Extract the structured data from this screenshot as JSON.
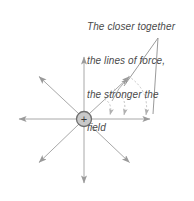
{
  "figure": {
    "kind": "physics-field-line-diagram",
    "width": 194,
    "height": 201,
    "background": "#ffffff"
  },
  "annotation": {
    "full_text": "The closer together the lines of force, the stronger the field",
    "lines": [
      "The closer together",
      "the lines of force,",
      "the stronger the",
      "field"
    ],
    "style": "italic",
    "color": "#4a4a4a"
  },
  "charge": {
    "symbol": "+",
    "label": "positive-point-charge",
    "center_x": 84,
    "center_y": 119,
    "radius": 7.5,
    "fill": "#c9c9c9",
    "stroke": "#6e6e6e",
    "symbol_color": "#3a3a3a"
  },
  "field_lines": {
    "count": 8,
    "stroke": "#a8a8a8",
    "stroke_width": 1,
    "directions": [
      {
        "name": "up",
        "angle_deg": 90,
        "tip_x": 84,
        "tip_y": 55
      },
      {
        "name": "up-right",
        "angle_deg": 45,
        "tip_x": 131,
        "tip_y": 75
      },
      {
        "name": "right",
        "angle_deg": 0,
        "tip_x": 152,
        "tip_y": 119
      },
      {
        "name": "down-right",
        "angle_deg": -45,
        "tip_x": 131,
        "tip_y": 164
      },
      {
        "name": "down",
        "angle_deg": -90,
        "tip_x": 84,
        "tip_y": 185
      },
      {
        "name": "down-left",
        "angle_deg": -135,
        "tip_x": 37,
        "tip_y": 164
      },
      {
        "name": "left",
        "angle_deg": 180,
        "tip_x": 17,
        "tip_y": 119
      },
      {
        "name": "up-left",
        "angle_deg": 135,
        "tip_x": 37,
        "tip_y": 75
      }
    ]
  },
  "spacing_arcs": {
    "count": 3,
    "stroke": "#c4c4c4",
    "dash": "2 2",
    "description": "dashed arcs spanning from the up-right field line down to the right field line, showing increasing separation with distance",
    "arcs": [
      {
        "start_x": 104,
        "start_y": 99,
        "end_x": 110,
        "end_y": 117,
        "ctrl_x": 113,
        "ctrl_y": 103
      },
      {
        "start_x": 114,
        "start_y": 89,
        "end_x": 124,
        "end_y": 117,
        "ctrl_x": 128,
        "ctrl_y": 97
      },
      {
        "start_x": 128,
        "start_y": 76,
        "end_x": 146,
        "end_y": 117,
        "ctrl_x": 150,
        "ctrl_y": 90
      }
    ]
  },
  "leader": {
    "apex_x": 158,
    "apex_y": 38,
    "stroke": "#8f8f8f",
    "targets": [
      {
        "x": 124,
        "y": 85
      },
      {
        "x": 152,
        "y": 116
      }
    ]
  },
  "arc_return_arrow": {
    "name": "upward-arc-arrow",
    "stroke": "#a8a8a8",
    "from_x": 113,
    "from_y": 100,
    "to_x": 128,
    "to_y": 77
  }
}
